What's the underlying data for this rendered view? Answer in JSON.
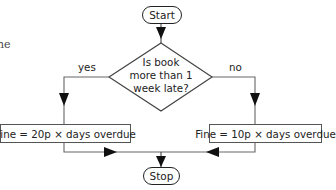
{
  "cropped_text": "ne",
  "flowchart": {
    "start": {
      "label": "Start"
    },
    "decision": {
      "lines": [
        "Is book",
        "more than 1",
        "week late?"
      ]
    },
    "branches": {
      "yes": {
        "label": "yes"
      },
      "no": {
        "label": "no"
      }
    },
    "process_left": {
      "label": "Fine = 20p × days overdue"
    },
    "process_right": {
      "label": "Fine = 10p × days overdue"
    },
    "stop": {
      "label": "Stop"
    }
  },
  "colors": {
    "line": "#555555",
    "border": "#222222",
    "text": "#222222",
    "background": "#ffffff"
  }
}
